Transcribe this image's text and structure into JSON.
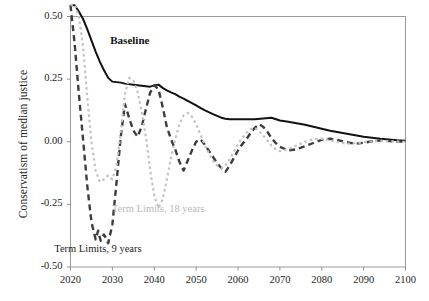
{
  "chart_data": {
    "type": "line",
    "title": "",
    "xlabel": "",
    "ylabel": "Conservatism of median justice",
    "xlim": [
      2020,
      2100
    ],
    "ylim": [
      -0.5,
      0.5
    ],
    "grid": false,
    "legend_position": "inline-annotations",
    "xticks": [
      "2020",
      "2030",
      "2040",
      "2050",
      "2060",
      "2070",
      "2080",
      "2090",
      "2100"
    ],
    "xtick_values": [
      2020,
      2030,
      2040,
      2050,
      2060,
      2070,
      2080,
      2090,
      2100
    ],
    "yticks": [
      "0.50",
      "0.25",
      "0.00",
      "-0.25",
      "-0.50"
    ],
    "ytick_values": [
      0.5,
      0.25,
      0.0,
      -0.25,
      -0.5
    ],
    "annotations": [
      {
        "name": "baseline",
        "text": "Baseline",
        "x": 2029.5,
        "y": 0.4,
        "color": "#111111"
      },
      {
        "name": "term-limits-9",
        "text": "Term Limits, 9 years",
        "x": 2026.5,
        "y": -0.435,
        "color": "#1d1d1d"
      },
      {
        "name": "term-limits-18",
        "text": "Term Limits, 18 years",
        "x": 2041.0,
        "y": -0.275,
        "color": "#b9b9b9"
      }
    ],
    "series": [
      {
        "name": "Baseline",
        "style": "solid",
        "color": "#111111",
        "width": 2.0,
        "x": [
          2020,
          2021,
          2022,
          2023,
          2024,
          2025,
          2026,
          2027,
          2028,
          2029,
          2030,
          2031,
          2032,
          2033,
          2034,
          2035,
          2036,
          2037,
          2038,
          2039,
          2040,
          2041,
          2042,
          2043,
          2044,
          2045,
          2046,
          2047,
          2048,
          2049,
          2050,
          2051,
          2052,
          2053,
          2054,
          2055,
          2056,
          2057,
          2058,
          2059,
          2060,
          2062,
          2064,
          2066,
          2068,
          2070,
          2072,
          2074,
          2076,
          2078,
          2080,
          2082,
          2084,
          2086,
          2088,
          2090,
          2092,
          2094,
          2096,
          2098,
          2100
        ],
        "values": [
          0.545,
          0.545,
          0.52,
          0.49,
          0.45,
          0.405,
          0.36,
          0.32,
          0.285,
          0.255,
          0.24,
          0.238,
          0.236,
          0.232,
          0.23,
          0.228,
          0.226,
          0.224,
          0.222,
          0.22,
          0.225,
          0.228,
          0.215,
          0.205,
          0.197,
          0.19,
          0.18,
          0.172,
          0.163,
          0.154,
          0.145,
          0.135,
          0.126,
          0.118,
          0.11,
          0.103,
          0.096,
          0.092,
          0.09,
          0.09,
          0.09,
          0.09,
          0.09,
          0.093,
          0.096,
          0.085,
          0.08,
          0.074,
          0.068,
          0.06,
          0.052,
          0.044,
          0.038,
          0.032,
          0.026,
          0.02,
          0.016,
          0.012,
          0.009,
          0.006,
          0.004
        ]
      },
      {
        "name": "Term Limits, 9 years",
        "style": "dashed",
        "color": "#3d3d3d",
        "width": 2.4,
        "dasharray": "6,4",
        "x": [
          2020,
          2021,
          2022,
          2023,
          2024,
          2025,
          2026,
          2026.6,
          2027.2,
          2028,
          2029,
          2030,
          2031,
          2032,
          2033,
          2034,
          2035,
          2036,
          2037,
          2038,
          2039,
          2040,
          2041,
          2042,
          2043,
          2044,
          2045,
          2046,
          2047,
          2048,
          2049,
          2050,
          2051,
          2052,
          2053,
          2054,
          2055,
          2056,
          2057,
          2058,
          2059,
          2060,
          2061,
          2062,
          2063,
          2064,
          2065,
          2066,
          2067,
          2068,
          2069,
          2070,
          2072,
          2074,
          2076,
          2078,
          2080,
          2082,
          2084,
          2086,
          2088,
          2090,
          2092,
          2094,
          2096,
          2098,
          2100
        ],
        "values": [
          0.545,
          0.39,
          0.19,
          0.01,
          -0.175,
          -0.32,
          -0.39,
          -0.355,
          -0.395,
          -0.37,
          -0.405,
          -0.33,
          -0.16,
          0.02,
          0.15,
          0.095,
          0.045,
          0.02,
          0.06,
          0.13,
          0.195,
          0.225,
          0.21,
          0.14,
          0.06,
          0.01,
          -0.03,
          -0.08,
          -0.115,
          -0.075,
          -0.035,
          0.0,
          0.01,
          -0.01,
          -0.035,
          -0.06,
          -0.085,
          -0.105,
          -0.12,
          -0.095,
          -0.065,
          -0.035,
          -0.01,
          0.01,
          0.035,
          0.055,
          0.07,
          0.06,
          0.04,
          0.015,
          -0.005,
          -0.02,
          -0.035,
          -0.03,
          -0.018,
          -0.005,
          0.008,
          0.012,
          0.006,
          -0.002,
          -0.008,
          -0.004,
          0.002,
          0.005,
          0.003,
          0.001,
          0.0
        ]
      },
      {
        "name": "Term Limits, 18 years",
        "style": "dotted",
        "color": "#c2c2c2",
        "width": 2.2,
        "dasharray": "2.5,3",
        "x": [
          2020,
          2021,
          2022,
          2023,
          2024,
          2025,
          2026,
          2027,
          2028,
          2029,
          2030,
          2031,
          2032,
          2033,
          2034,
          2035,
          2036,
          2037,
          2038,
          2039,
          2040,
          2041,
          2042,
          2043,
          2044,
          2045,
          2046,
          2047,
          2048,
          2049,
          2050,
          2051,
          2052,
          2053,
          2054,
          2055,
          2056,
          2057,
          2058,
          2059,
          2060,
          2061,
          2062,
          2063,
          2064,
          2065,
          2066,
          2067,
          2068,
          2069,
          2070,
          2072,
          2074,
          2076,
          2078,
          2080,
          2082,
          2084,
          2086,
          2088,
          2090,
          2092,
          2094,
          2096,
          2098,
          2100
        ],
        "values": [
          0.545,
          0.548,
          0.5,
          0.38,
          0.18,
          0.0,
          -0.115,
          -0.16,
          -0.15,
          -0.135,
          -0.15,
          -0.095,
          0.04,
          0.19,
          0.255,
          0.245,
          0.2,
          0.12,
          0.02,
          -0.11,
          -0.215,
          -0.265,
          -0.23,
          -0.15,
          -0.065,
          0.01,
          0.07,
          0.105,
          0.115,
          0.1,
          0.07,
          0.03,
          -0.01,
          -0.045,
          -0.075,
          -0.095,
          -0.105,
          -0.095,
          -0.07,
          -0.04,
          -0.01,
          0.015,
          0.035,
          0.05,
          0.055,
          0.045,
          0.025,
          0.005,
          -0.015,
          -0.03,
          -0.038,
          -0.03,
          -0.015,
          0.0,
          0.01,
          0.012,
          0.006,
          -0.002,
          -0.008,
          -0.006,
          -0.002,
          0.002,
          0.004,
          0.002,
          0.001,
          0.0
        ]
      }
    ]
  }
}
